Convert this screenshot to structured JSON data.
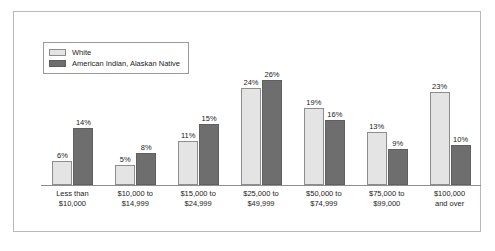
{
  "chart_data": {
    "type": "bar",
    "title": "",
    "xlabel": "",
    "ylabel": "",
    "ylim": [
      0,
      26
    ],
    "grid": false,
    "legend_position": "top-left",
    "categories": [
      {
        "line1": "Less than",
        "line2": "$10,000"
      },
      {
        "line1": "$10,000 to",
        "line2": "$14,999"
      },
      {
        "line1": "$15,000 to",
        "line2": "$24,999"
      },
      {
        "line1": "$25,000 to",
        "line2": "$49,999"
      },
      {
        "line1": "$50,000 to",
        "line2": "$74,999"
      },
      {
        "line1": "$75,000 to",
        "line2": "$99,000"
      },
      {
        "line1": "$100,000",
        "line2": "and over"
      }
    ],
    "series": [
      {
        "name": "White",
        "color": "#e4e4e4",
        "values": [
          6,
          5,
          11,
          24,
          19,
          13,
          23
        ],
        "labels": [
          "6%",
          "5%",
          "11%",
          "24%",
          "19%",
          "13%",
          "23%"
        ]
      },
      {
        "name": "American Indian, Alaskan Native",
        "color": "#6e6e6e",
        "values": [
          14,
          8,
          15,
          26,
          16,
          9,
          10
        ],
        "labels": [
          "14%",
          "8%",
          "15%",
          "26%",
          "16%",
          "9%",
          "10%"
        ]
      }
    ]
  },
  "legend": {
    "items": [
      {
        "label": "White",
        "swatch": "light"
      },
      {
        "label": "American Indian, Alaskan Native",
        "swatch": "dark"
      }
    ]
  }
}
